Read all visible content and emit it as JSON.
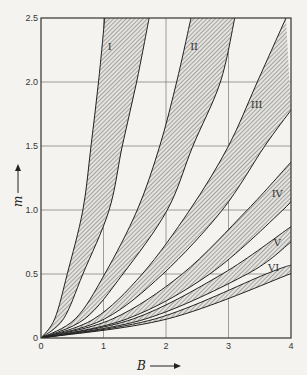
{
  "chart_data": {
    "type": "area",
    "title": "",
    "xlabel": "B",
    "ylabel": "m",
    "xlim": [
      0,
      4
    ],
    "ylim": [
      0,
      2.5
    ],
    "grid": true,
    "x_ticks": [
      "0",
      "1",
      "2",
      "3",
      "4"
    ],
    "y_ticks": [
      "0",
      "0.5",
      "1.0",
      "1.5",
      "2.0",
      "2.5"
    ],
    "x_tick_values": [
      0,
      1,
      2,
      3,
      4
    ],
    "y_tick_values": [
      0,
      0.5,
      1.0,
      1.5,
      2.0,
      2.5
    ],
    "bands": [
      {
        "name": "I",
        "lower": [
          [
            0,
            0
          ],
          [
            0.22,
            0.15
          ],
          [
            0.42,
            0.5
          ],
          [
            0.67,
            1.0
          ],
          [
            0.8,
            1.5
          ],
          [
            0.92,
            2.0
          ],
          [
            1.02,
            2.5
          ]
        ],
        "upper": [
          [
            0,
            0
          ],
          [
            0.36,
            0.15
          ],
          [
            0.67,
            0.5
          ],
          [
            1.09,
            1.0
          ],
          [
            1.3,
            1.5
          ],
          [
            1.53,
            2.0
          ],
          [
            1.73,
            2.5
          ]
        ],
        "label_at": [
          1.1,
          2.25
        ]
      },
      {
        "name": "II",
        "lower": [
          [
            0,
            0
          ],
          [
            0.55,
            0.15
          ],
          [
            1.02,
            0.5
          ],
          [
            1.54,
            1.0
          ],
          [
            1.9,
            1.5
          ],
          [
            2.17,
            2.0
          ],
          [
            2.4,
            2.5
          ]
        ],
        "upper": [
          [
            0,
            0
          ],
          [
            0.7,
            0.15
          ],
          [
            1.31,
            0.5
          ],
          [
            2.02,
            1.0
          ],
          [
            2.43,
            1.5
          ],
          [
            2.87,
            2.0
          ],
          [
            3.1,
            2.5
          ]
        ],
        "label_at": [
          2.45,
          2.25
        ]
      },
      {
        "name": "III",
        "lower": [
          [
            0,
            0
          ],
          [
            0.85,
            0.15
          ],
          [
            1.62,
            0.5
          ],
          [
            2.38,
            1.0
          ],
          [
            3.0,
            1.5
          ],
          [
            3.46,
            2.0
          ],
          [
            3.92,
            2.5
          ]
        ],
        "upper": [
          [
            0,
            0
          ],
          [
            1.02,
            0.15
          ],
          [
            1.95,
            0.5
          ],
          [
            2.9,
            1.0
          ],
          [
            3.58,
            1.5
          ],
          [
            4.0,
            1.78
          ]
        ],
        "label_at": [
          3.45,
          1.8
        ]
      },
      {
        "name": "IV",
        "lower": [
          [
            0,
            0
          ],
          [
            1.15,
            0.15
          ],
          [
            2.26,
            0.5
          ],
          [
            3.3,
            1.0
          ],
          [
            4.0,
            1.375
          ]
        ],
        "upper": [
          [
            0,
            0
          ],
          [
            1.38,
            0.15
          ],
          [
            2.7,
            0.5
          ],
          [
            3.87,
            1.0
          ],
          [
            4.0,
            1.09
          ]
        ],
        "label_at": [
          3.78,
          1.1
        ]
      },
      {
        "name": "V",
        "lower": [
          [
            0,
            0
          ],
          [
            1.48,
            0.15
          ],
          [
            2.9,
            0.5
          ],
          [
            4.0,
            0.87
          ]
        ],
        "upper": [
          [
            0,
            0
          ],
          [
            1.68,
            0.15
          ],
          [
            3.3,
            0.5
          ],
          [
            4.0,
            0.75
          ]
        ],
        "label_at": [
          3.78,
          0.72
        ]
      },
      {
        "name": "VI",
        "lower": [
          [
            0,
            0
          ],
          [
            1.83,
            0.15
          ],
          [
            3.6,
            0.5
          ],
          [
            4.0,
            0.57
          ]
        ],
        "upper": [
          [
            0,
            0
          ],
          [
            2.03,
            0.15
          ],
          [
            3.98,
            0.5
          ],
          [
            4.0,
            0.52
          ]
        ],
        "label_at": [
          3.72,
          0.52
        ]
      }
    ]
  }
}
